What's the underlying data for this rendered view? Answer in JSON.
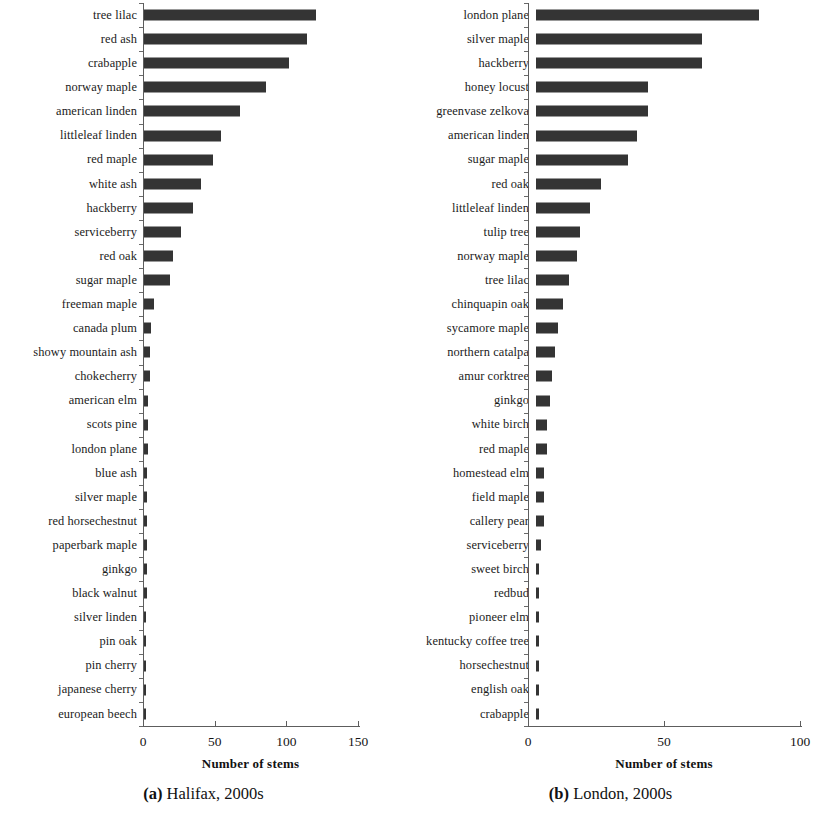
{
  "figure": {
    "panels": [
      {
        "caption_tag": "(a)",
        "caption_text": "Halifax, 2000s",
        "xlabel": "Number of stems"
      },
      {
        "caption_tag": "(b)",
        "caption_text": "London, 2000s",
        "xlabel": "Number of stems"
      }
    ]
  },
  "chart_data": [
    {
      "type": "bar",
      "orientation": "horizontal",
      "title": "(a) Halifax, 2000s",
      "subtitle": "",
      "xlabel": "Number of stems",
      "ylabel": "",
      "xlim": [
        0,
        150
      ],
      "xticks": [
        0,
        50,
        100,
        150
      ],
      "xtick_labels": [
        "0",
        "50",
        "100",
        "150"
      ],
      "grid": false,
      "legend": null,
      "bar_color": "#343434",
      "categories": [
        "tree lilac",
        "red ash",
        "crabapple",
        "norway maple",
        "american linden",
        "littleleaf linden",
        "red maple",
        "white ash",
        "hackberry",
        "serviceberry",
        "red oak",
        "sugar maple",
        "freeman maple",
        "canada plum",
        "showy mountain ash",
        "chokecherry",
        "american elm",
        "scots pine",
        "london plane",
        "blue ash",
        "silver maple",
        "red horsechestnut",
        "paperbark maple",
        "ginkgo",
        "black walnut",
        "silver linden",
        "pin oak",
        "pin cherry",
        "japanese cherry",
        "european beech"
      ],
      "values": [
        120,
        114,
        101,
        85,
        67,
        54,
        48,
        40,
        34,
        26,
        20,
        18,
        7,
        5,
        4,
        4,
        3,
        3,
        3,
        2,
        2,
        2,
        2,
        2,
        2,
        1,
        1,
        1,
        1,
        1
      ]
    },
    {
      "type": "bar",
      "orientation": "horizontal",
      "title": "(b) London, 2000s",
      "subtitle": "",
      "xlabel": "Number of stems",
      "ylabel": "",
      "xlim": [
        0,
        100
      ],
      "xticks": [
        0,
        50,
        100
      ],
      "xtick_labels": [
        "0",
        "50",
        "100"
      ],
      "grid": false,
      "legend": null,
      "bar_color": "#343434",
      "categories": [
        "london plane",
        "silver maple",
        "hackberry",
        "honey locust",
        "greenvase zelkova",
        "american linden",
        "sugar maple",
        "red oak",
        "littleleaf linden",
        "tulip tree",
        "norway maple",
        "tree lilac",
        "chinquapin oak",
        "sycamore maple",
        "northern catalpa",
        "amur corktree",
        "ginkgo",
        "white birch",
        "red maple",
        "homestead elm",
        "field maple",
        "callery pear",
        "serviceberry",
        "sweet birch",
        "redbud",
        "pioneer elm",
        "kentucky coffee tree",
        "horsechestnut",
        "english oak",
        "crabapple"
      ],
      "values": [
        82,
        61,
        61,
        41,
        41,
        37,
        34,
        24,
        20,
        16,
        15,
        12,
        10,
        8,
        7,
        6,
        5,
        4,
        4,
        3,
        3,
        3,
        2,
        1,
        1,
        1,
        1,
        1,
        1,
        1
      ]
    }
  ]
}
